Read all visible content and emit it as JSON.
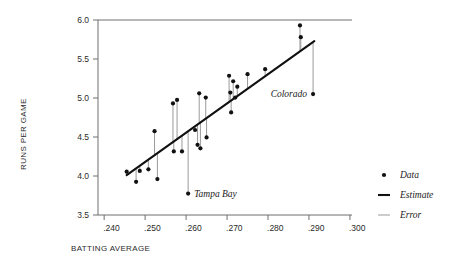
{
  "chart_data": {
    "type": "scatter",
    "title": "",
    "xlabel": "BATTING AVERAGE",
    "ylabel": "RUNS PER GAME",
    "xlim": [
      0.2385,
      0.3005
    ],
    "ylim": [
      3.5,
      6.0
    ],
    "grid": false,
    "xticks": [
      0.24,
      0.25,
      0.26,
      0.27,
      0.28,
      0.29,
      0.3
    ],
    "xtick_labels": [
      ".240",
      ".250",
      ".260",
      ".270",
      ".280",
      ".290",
      ".300"
    ],
    "yticks": [
      3.5,
      4.0,
      4.5,
      5.0,
      5.5,
      6.0
    ],
    "ytick_labels": [
      "3.5",
      "4.0",
      "4.5",
      "5.0",
      "5.5",
      "6.0"
    ],
    "legend_position": "right-outside",
    "legend": [
      {
        "key": "data",
        "label": "Data",
        "marker": "dot",
        "color": "#111111"
      },
      {
        "key": "estimate",
        "label": "Estimate",
        "marker": "thick-line",
        "color": "#111111"
      },
      {
        "key": "error",
        "label": "Error",
        "marker": "thin-line",
        "color": "#9a9a9a"
      }
    ],
    "estimate_line": {
      "x_start": 0.2455,
      "y_start": 4.01,
      "x_end": 0.2913,
      "y_end": 5.73,
      "slope": 37.55,
      "intercept": -5.21
    },
    "points": [
      {
        "x": 0.2455,
        "y": 4.055,
        "fit": 4.011
      },
      {
        "x": 0.2478,
        "y": 3.925,
        "fit": 4.097
      },
      {
        "x": 0.2487,
        "y": 4.065,
        "fit": 4.131
      },
      {
        "x": 0.2508,
        "y": 4.085,
        "fit": 4.21
      },
      {
        "x": 0.2523,
        "y": 4.575,
        "fit": 4.266
      },
      {
        "x": 0.253,
        "y": 3.96,
        "fit": 4.293
      },
      {
        "x": 0.2568,
        "y": 4.93,
        "fit": 4.435
      },
      {
        "x": 0.257,
        "y": 4.315,
        "fit": 4.443
      },
      {
        "x": 0.2578,
        "y": 4.975,
        "fit": 4.473
      },
      {
        "x": 0.259,
        "y": 4.315,
        "fit": 4.518
      },
      {
        "x": 0.2605,
        "y": 3.775,
        "fit": 4.574,
        "label": "Tampa Bay"
      },
      {
        "x": 0.2622,
        "y": 4.59,
        "fit": 4.638
      },
      {
        "x": 0.2628,
        "y": 4.4,
        "fit": 4.661
      },
      {
        "x": 0.2632,
        "y": 5.06,
        "fit": 4.676
      },
      {
        "x": 0.2635,
        "y": 4.355,
        "fit": 4.687
      },
      {
        "x": 0.2648,
        "y": 5.005,
        "fit": 4.736
      },
      {
        "x": 0.265,
        "y": 4.495,
        "fit": 4.743
      },
      {
        "x": 0.2705,
        "y": 5.285,
        "fit": 4.95
      },
      {
        "x": 0.2708,
        "y": 5.07,
        "fit": 4.961
      },
      {
        "x": 0.271,
        "y": 4.815,
        "fit": 4.969
      },
      {
        "x": 0.2715,
        "y": 5.215,
        "fit": 4.987
      },
      {
        "x": 0.272,
        "y": 5.005,
        "fit": 5.006
      },
      {
        "x": 0.2725,
        "y": 5.145,
        "fit": 5.025
      },
      {
        "x": 0.275,
        "y": 5.305,
        "fit": 5.119
      },
      {
        "x": 0.2793,
        "y": 5.37,
        "fit": 5.28
      },
      {
        "x": 0.2878,
        "y": 5.93,
        "fit": 5.6
      },
      {
        "x": 0.288,
        "y": 5.78,
        "fit": 5.607
      },
      {
        "x": 0.291,
        "y": 5.05,
        "fit": 5.72,
        "label": "Colorado"
      }
    ],
    "annotations": [
      {
        "key": "tampa-bay",
        "text": "Tampa Bay",
        "x": 0.2605,
        "y": 3.775,
        "side": "right"
      },
      {
        "key": "colorado",
        "text": "Colorado",
        "x": 0.291,
        "y": 5.05,
        "side": "left"
      }
    ]
  }
}
